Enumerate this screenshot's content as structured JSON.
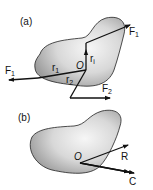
{
  "panel_a": {
    "label": "(a)",
    "force_top": "F",
    "force_top_sub": "1",
    "force_left": "F",
    "force_left_sub": "1",
    "force_bottom": "F",
    "force_bottom_sub": "2",
    "r1": "r",
    "r1_sub": "1",
    "r2": "r",
    "r2_sub": "2",
    "ri": "r",
    "ri_sub": "i",
    "origin": "O"
  },
  "panel_b": {
    "label": "(b)",
    "origin": "O",
    "resultant": "R",
    "couple": "C"
  },
  "colors": {
    "body_fill_light": "#f4f4f4",
    "body_fill_dark": "#a8a8a8",
    "line": "#111111"
  }
}
